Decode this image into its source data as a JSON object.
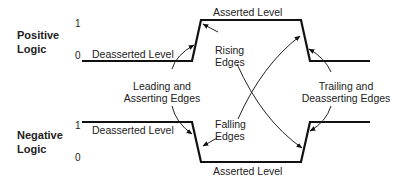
{
  "rows": {
    "positive": {
      "label_line1": "Positive",
      "label_line2": "Logic",
      "tick_high": "1",
      "tick_low": "0",
      "deasserted_label": "Deasserted Level",
      "asserted_label": "Asserted Level"
    },
    "negative": {
      "label_line1": "Negative",
      "label_line2": "Logic",
      "tick_high": "1",
      "tick_low": "0",
      "deasserted_label": "Deasserted Level",
      "asserted_label": "Asserted Level"
    }
  },
  "annotations": {
    "rising_line1": "Rising",
    "rising_line2": "Edges",
    "falling_line1": "Falling",
    "falling_line2": "Edges",
    "leading_line1": "Leading and",
    "leading_line2": "Asserting Edges",
    "trailing_line1": "Trailing and",
    "trailing_line2": "Deasserting Edges"
  },
  "colors": {
    "line": "#111111",
    "background": "#ffffff"
  }
}
